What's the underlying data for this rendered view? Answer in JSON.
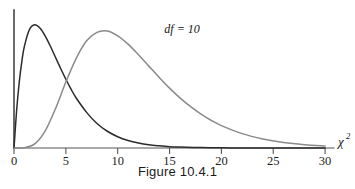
{
  "caption": "Figure 10.4.1",
  "chart_data": {
    "type": "line",
    "title": "Figure 10.4.1",
    "xlabel": "χ²",
    "ylabel": "",
    "xlim": [
      0,
      30
    ],
    "ylim": [
      0,
      0.2
    ],
    "grid": false,
    "legend_position": "inline-annotation",
    "xticks": [
      0,
      5,
      10,
      15,
      20,
      25,
      30
    ],
    "xtick_labels": [
      "0",
      "5",
      "10",
      "15",
      "20",
      "25",
      "30"
    ],
    "yticks": [],
    "ytick_labels": [],
    "axis_title_base": "χ",
    "axis_title_exponent": "2",
    "series": [
      {
        "name": "df = 4",
        "label": "df = 4",
        "df": 4,
        "color": "#2b2b2b",
        "peak_x": 2,
        "peak_y": 0.1839,
        "label_x": 6.0,
        "label_y": 0.158,
        "x": [
          0,
          0.25,
          0.5,
          0.75,
          1,
          1.5,
          2,
          2.5,
          3,
          3.5,
          4,
          4.5,
          5,
          5.5,
          6,
          7,
          8,
          9,
          10,
          11,
          12,
          13,
          14,
          15,
          16,
          18,
          20,
          22,
          24,
          26,
          28,
          30
        ],
        "y": [
          0,
          0.0277,
          0.0487,
          0.0643,
          0.0758,
          0.0886,
          0.092,
          0.0895,
          0.0837,
          0.0761,
          0.0677,
          0.0593,
          0.0513,
          0.0439,
          0.0373,
          0.0266,
          0.0183,
          0.0125,
          0.0084,
          0.0056,
          0.0037,
          0.0024,
          0.0016,
          0.001,
          0.0007,
          0.0003,
          0.0001,
          5e-05,
          2e-05,
          1e-05,
          4e-06,
          2e-06
        ]
      },
      {
        "name": "df = 10",
        "label": "df = 10",
        "df": 10,
        "color": "#8a8a8a",
        "peak_x": 8,
        "peak_y": 0.0976,
        "label_x": 14.5,
        "label_y": 0.0855,
        "x": [
          0,
          1,
          2,
          3,
          4,
          5,
          6,
          7,
          8,
          9,
          10,
          11,
          12,
          13,
          14,
          15,
          16,
          17,
          18,
          19,
          20,
          22,
          24,
          26,
          28,
          30
        ],
        "y": [
          0,
          0.0002,
          0.0031,
          0.0126,
          0.0293,
          0.0492,
          0.0669,
          0.08,
          0.0863,
          0.0873,
          0.0837,
          0.0775,
          0.0696,
          0.0611,
          0.0527,
          0.0447,
          0.0374,
          0.031,
          0.0255,
          0.0207,
          0.0167,
          0.0107,
          0.0067,
          0.0041,
          0.0025,
          0.0015
        ]
      }
    ]
  },
  "geometry": {
    "origin_x": 14,
    "origin_y": 148,
    "x_unit_px": 10.37,
    "y_scale_px": 1340,
    "y_axis_top": 10,
    "x_axis_right": 334,
    "tick_length": 6
  }
}
